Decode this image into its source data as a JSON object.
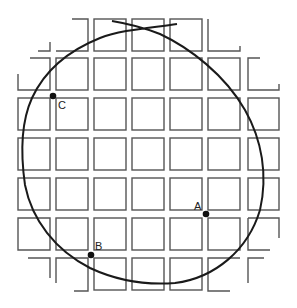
{
  "diagram": {
    "colors": {
      "grid": "#555555",
      "curve": "#1a1a1a",
      "point": "#111111",
      "background": "#ffffff"
    },
    "points": [
      {
        "label": "A",
        "x": 206,
        "y": 214
      },
      {
        "label": "B",
        "x": 91,
        "y": 255
      },
      {
        "label": "C",
        "x": 53,
        "y": 96
      }
    ]
  }
}
